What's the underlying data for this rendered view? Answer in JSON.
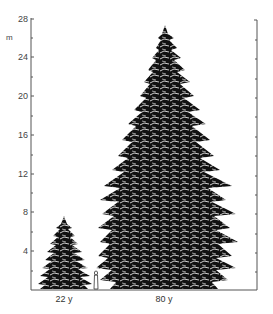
{
  "figure": {
    "y_axis": {
      "unit": "m",
      "ticks": [
        "28",
        "24",
        "20",
        "16",
        "12",
        "8",
        "4"
      ],
      "range": [
        0,
        28
      ]
    },
    "trees": [
      {
        "label": "22 y",
        "height_m": 7.5
      },
      {
        "label": "80 y",
        "height_m": 27
      }
    ],
    "scale_figure": "human silhouette",
    "colors": {
      "ink": "#111111",
      "axis": "#555555",
      "background": "#ffffff"
    }
  }
}
